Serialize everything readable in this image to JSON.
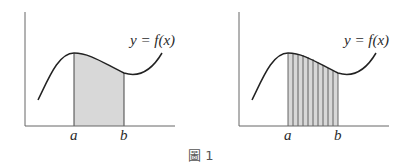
{
  "figure": {
    "caption": "圖 1",
    "left_panel": {
      "curve_label": "y = f(x)",
      "x_label_a": "a",
      "x_label_b": "b",
      "shading": "solid"
    },
    "right_panel": {
      "curve_label": "y = f(x)",
      "x_label_a": "a",
      "x_label_b": "b",
      "shading": "vertical-strips",
      "strip_count": 10
    }
  },
  "colors": {
    "line": "#222222",
    "fill": "#d8d8d8",
    "strip_line": "#555555"
  }
}
